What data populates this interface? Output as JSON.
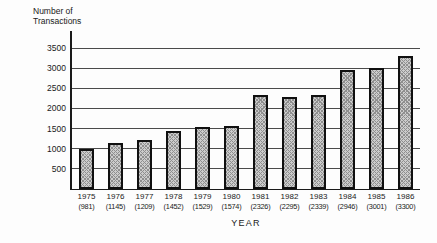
{
  "title": {
    "line1": "Number of",
    "line2": "Transactions"
  },
  "xlabel": "YEAR",
  "chart_data": {
    "type": "bar",
    "title": "Number of Transactions",
    "xlabel": "YEAR",
    "ylabel": "Number of Transactions",
    "categories": [
      "1975",
      "1976",
      "1977",
      "1978",
      "1979",
      "1980",
      "1981",
      "1982",
      "1983",
      "1984",
      "1985",
      "1986"
    ],
    "values": [
      981,
      1145,
      1209,
      1452,
      1529,
      1574,
      2326,
      2295,
      2339,
      2946,
      3001,
      3300
    ],
    "value_labels": [
      "(981)",
      "(1145)",
      "(1209)",
      "(1452)",
      "(1529)",
      "(1574)",
      "(2326)",
      "(2295)",
      "(2339)",
      "(2946)",
      "(3001)",
      "(3300)"
    ],
    "yticks": [
      500,
      1000,
      1500,
      2000,
      2500,
      3000,
      3500
    ],
    "ylim": [
      0,
      3500
    ],
    "grid": true,
    "legend": "none",
    "bar_fill": "#cccccc",
    "bar_pattern": "crosshatch",
    "bar_border": "#101010",
    "background": "#fdfdfd",
    "text_color": "#1a1a1a"
  }
}
